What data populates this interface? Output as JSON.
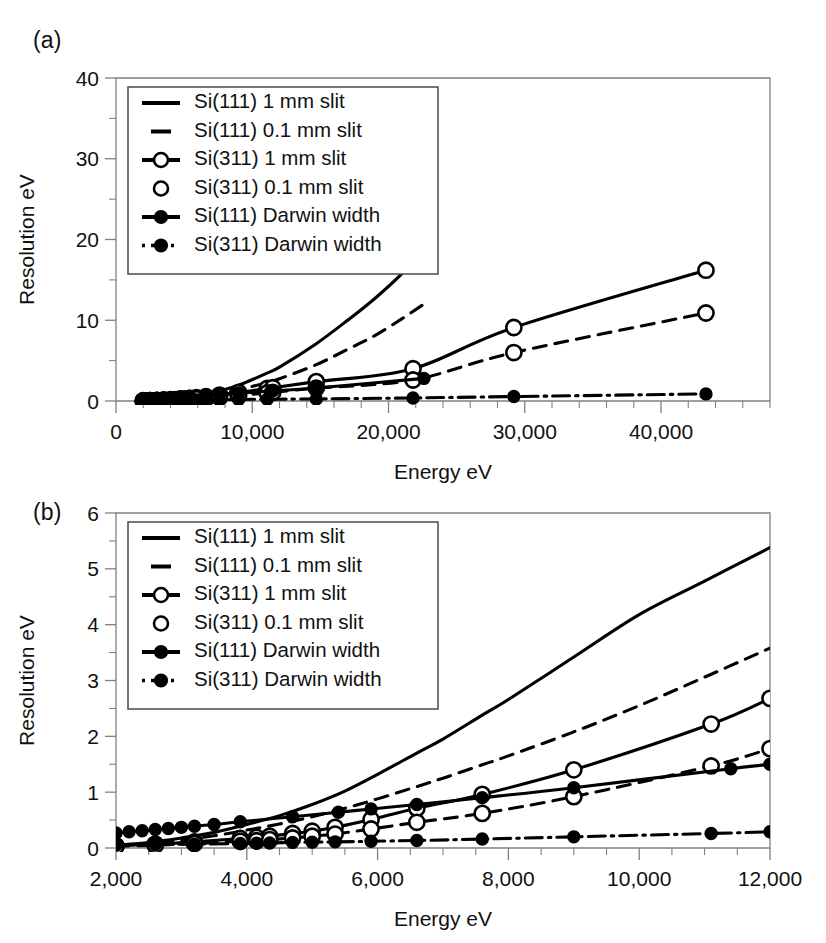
{
  "figure": {
    "panels": [
      {
        "tag": "(a)",
        "axes": {
          "xlabel": "Energy eV",
          "ylabel": "Resolution eV",
          "xlim": [
            0,
            48000
          ],
          "ylim": [
            0,
            40
          ],
          "xticks": [
            0,
            10000,
            20000,
            30000,
            40000
          ],
          "xtick_labels": [
            "0",
            "10,000",
            "20,000",
            "30,000",
            "40,000"
          ],
          "yticks": [
            0,
            10,
            20,
            30,
            40
          ],
          "ytick_labels": [
            "0",
            "10",
            "20",
            "30",
            "40"
          ],
          "x_minor_step": 2000,
          "y_minor_step": 5,
          "grid": false
        },
        "legend": {
          "position": "top-left",
          "entries": [
            {
              "label": "Si(111) 1 mm slit",
              "style": "solid",
              "marker": "none"
            },
            {
              "label": "Si(111) 0.1 mm slit",
              "style": "dash",
              "marker": "none"
            },
            {
              "label": "Si(311) 1 mm slit",
              "style": "solid",
              "marker": "open"
            },
            {
              "label": "Si(311) 0.1 mm slit",
              "style": "none",
              "marker": "open"
            },
            {
              "label": "Si(111) Darwin width",
              "style": "solid",
              "marker": "filled"
            },
            {
              "label": "Si(311) Darwin width",
              "style": "dashdot",
              "marker": "filled"
            }
          ]
        }
      },
      {
        "tag": "(b)",
        "axes": {
          "xlabel": "Energy eV",
          "ylabel": "Resolution eV",
          "xlim": [
            2000,
            12000
          ],
          "ylim": [
            0,
            6
          ],
          "xticks": [
            2000,
            4000,
            6000,
            8000,
            10000,
            12000
          ],
          "xtick_labels": [
            "2,000",
            "4,000",
            "6,000",
            "8,000",
            "10,000",
            "12,000"
          ],
          "yticks": [
            0,
            1,
            2,
            3,
            4,
            5,
            6
          ],
          "ytick_labels": [
            "0",
            "1",
            "2",
            "3",
            "4",
            "5",
            "6"
          ],
          "x_minor_step": 500,
          "y_minor_step": 0.5,
          "grid": false
        },
        "legend": {
          "position": "top-left",
          "entries": [
            {
              "label": "Si(111) 1 mm slit",
              "style": "solid",
              "marker": "none"
            },
            {
              "label": "Si(111) 0.1 mm slit",
              "style": "dash",
              "marker": "none"
            },
            {
              "label": "Si(311) 1 mm slit",
              "style": "solid",
              "marker": "open"
            },
            {
              "label": "Si(311) 0.1 mm slit",
              "style": "none",
              "marker": "open"
            },
            {
              "label": "Si(111) Darwin width",
              "style": "solid",
              "marker": "filled"
            },
            {
              "label": "Si(311) Darwin width",
              "style": "dashdot",
              "marker": "filled"
            }
          ]
        }
      }
    ]
  },
  "chart_data": [
    {
      "type": "line",
      "title": "(a)",
      "xlabel": "Energy eV",
      "ylabel": "Resolution eV",
      "xlim": [
        0,
        48000
      ],
      "ylim": [
        0,
        40
      ],
      "grid": false,
      "legend_position": "top-left",
      "series": [
        {
          "name": "Si(111) 1 mm slit",
          "style": "solid",
          "marker": "none",
          "x": [
            2000,
            2500,
            3000,
            3500,
            4000,
            4500,
            5000,
            5500,
            6000,
            6600,
            7600,
            9000,
            11000,
            12000,
            14700,
            17000,
            19000,
            21000,
            22600
          ],
          "y": [
            0.05,
            0.08,
            0.12,
            0.17,
            0.23,
            0.31,
            0.41,
            0.53,
            0.66,
            0.86,
            1.25,
            1.95,
            3.4,
            4.2,
            7.1,
            10.0,
            12.7,
            15.8,
            19.0
          ]
        },
        {
          "name": "Si(111) 0.1 mm slit",
          "style": "dash",
          "marker": "none",
          "x": [
            2000,
            2500,
            3000,
            3500,
            4000,
            4500,
            5000,
            5500,
            6000,
            6600,
            7600,
            9000,
            11000,
            12000,
            14700,
            17000,
            19000,
            21000,
            22600
          ],
          "y": [
            0.04,
            0.06,
            0.09,
            0.13,
            0.18,
            0.24,
            0.31,
            0.4,
            0.5,
            0.64,
            0.92,
            1.38,
            2.25,
            2.75,
            4.5,
            6.4,
            8.1,
            10.2,
            12.0
          ]
        },
        {
          "name": "Si(311) 1 mm slit",
          "style": "solid",
          "marker": "open",
          "x": [
            2000,
            2500,
            3000,
            3500,
            4000,
            4300,
            4700,
            5000,
            5400,
            5900,
            6600,
            7600,
            9000,
            11100,
            11500,
            14700,
            21800,
            29200,
            43300
          ],
          "y": [
            0.03,
            0.05,
            0.07,
            0.1,
            0.14,
            0.17,
            0.21,
            0.25,
            0.31,
            0.4,
            0.53,
            0.73,
            1.05,
            1.55,
            1.65,
            2.4,
            4.0,
            9.1,
            16.2,
            37.0
          ]
        },
        {
          "name": "Si(311) 0.1 mm slit",
          "style": "dash",
          "marker": "open",
          "x": [
            2000,
            2500,
            3000,
            3500,
            4000,
            4300,
            4700,
            5000,
            5400,
            5900,
            6600,
            7600,
            9000,
            11100,
            11500,
            14700,
            21800,
            29200,
            43300
          ],
          "y": [
            0.02,
            0.03,
            0.05,
            0.07,
            0.09,
            0.11,
            0.14,
            0.16,
            0.2,
            0.26,
            0.34,
            0.47,
            0.68,
            1.0,
            1.06,
            1.6,
            2.6,
            6.0,
            10.9,
            24.7
          ]
        },
        {
          "name": "Si(111) Darwin width",
          "style": "solid",
          "marker": "filled",
          "x": [
            2000,
            2500,
            3000,
            3500,
            4000,
            4700,
            5400,
            6600,
            7600,
            9000,
            11500,
            14700,
            22600
          ],
          "y": [
            0.27,
            0.31,
            0.35,
            0.4,
            0.45,
            0.52,
            0.6,
            0.72,
            0.83,
            0.98,
            1.25,
            1.6,
            2.8
          ]
        },
        {
          "name": "Si(311) Darwin width",
          "style": "dashdot",
          "marker": "filled",
          "x": [
            2000,
            2500,
            3000,
            3500,
            4000,
            4300,
            4700,
            5000,
            5400,
            5900,
            6600,
            7600,
            9000,
            11100,
            14700,
            21800,
            29200,
            43300
          ],
          "y": [
            0.05,
            0.06,
            0.07,
            0.08,
            0.09,
            0.1,
            0.11,
            0.12,
            0.13,
            0.14,
            0.15,
            0.17,
            0.19,
            0.22,
            0.26,
            0.38,
            0.55,
            0.88
          ]
        }
      ]
    },
    {
      "type": "line",
      "title": "(b)",
      "xlabel": "Energy eV",
      "ylabel": "Resolution eV",
      "xlim": [
        2000,
        12000
      ],
      "ylim": [
        0,
        6
      ],
      "grid": false,
      "legend_position": "top-left",
      "series": [
        {
          "name": "Si(111) 1 mm slit",
          "style": "solid",
          "marker": "none",
          "x": [
            2000,
            2500,
            3000,
            3500,
            4000,
            4500,
            5000,
            5500,
            6000,
            6600,
            7000,
            7600,
            8000,
            9000,
            10000,
            11000,
            12000
          ],
          "y": [
            0.05,
            0.1,
            0.18,
            0.28,
            0.42,
            0.58,
            0.78,
            1.02,
            1.32,
            1.7,
            1.95,
            2.38,
            2.66,
            3.42,
            4.18,
            4.78,
            5.38
          ]
        },
        {
          "name": "Si(111) 0.1 mm slit",
          "style": "dash",
          "marker": "none",
          "x": [
            2000,
            2500,
            3000,
            3500,
            4000,
            4500,
            5000,
            5500,
            6000,
            6600,
            7000,
            7600,
            8000,
            9000,
            10000,
            11000,
            12000
          ],
          "y": [
            0.04,
            0.08,
            0.14,
            0.22,
            0.32,
            0.43,
            0.56,
            0.71,
            0.88,
            1.1,
            1.25,
            1.49,
            1.65,
            2.08,
            2.55,
            3.06,
            3.58
          ]
        },
        {
          "name": "Si(311) 1 mm slit",
          "style": "solid",
          "marker": "open",
          "x": [
            2000,
            2600,
            3200,
            3900,
            4150,
            4350,
            4700,
            5000,
            5350,
            5900,
            6600,
            7600,
            9000,
            11100,
            12000
          ],
          "y": [
            0.04,
            0.07,
            0.11,
            0.17,
            0.19,
            0.21,
            0.26,
            0.3,
            0.37,
            0.51,
            0.71,
            0.96,
            1.4,
            2.22,
            2.68
          ]
        },
        {
          "name": "Si(311) 0.1 mm slit",
          "style": "dash",
          "marker": "open",
          "x": [
            2000,
            2600,
            3200,
            3900,
            4150,
            4350,
            4700,
            5000,
            5350,
            5900,
            6600,
            7600,
            9000,
            11100,
            12000
          ],
          "y": [
            0.03,
            0.05,
            0.08,
            0.12,
            0.13,
            0.15,
            0.18,
            0.21,
            0.25,
            0.34,
            0.46,
            0.62,
            0.92,
            1.47,
            1.78
          ]
        },
        {
          "name": "Si(111) Darwin width",
          "style": "solid",
          "marker": "filled",
          "x": [
            2000,
            2200,
            2400,
            2600,
            2800,
            3000,
            3200,
            3500,
            3900,
            4700,
            5400,
            5900,
            6600,
            7600,
            9000,
            11400,
            12000
          ],
          "y": [
            0.27,
            0.29,
            0.31,
            0.33,
            0.35,
            0.37,
            0.39,
            0.42,
            0.47,
            0.56,
            0.64,
            0.7,
            0.78,
            0.9,
            1.08,
            1.42,
            1.5
          ]
        },
        {
          "name": "Si(311) Darwin width",
          "style": "dashdot",
          "marker": "filled",
          "x": [
            2000,
            2600,
            3200,
            3900,
            4150,
            4350,
            4700,
            5000,
            5350,
            5900,
            6600,
            7600,
            9000,
            11100,
            12000
          ],
          "y": [
            0.05,
            0.06,
            0.07,
            0.08,
            0.085,
            0.09,
            0.1,
            0.105,
            0.11,
            0.12,
            0.135,
            0.16,
            0.2,
            0.26,
            0.29
          ]
        }
      ]
    }
  ]
}
